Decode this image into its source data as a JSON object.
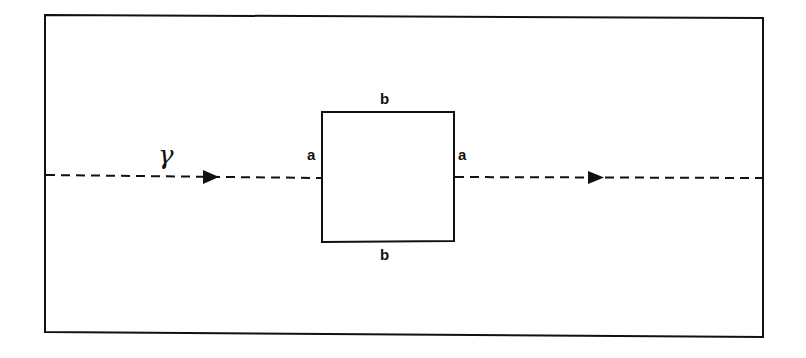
{
  "diagram": {
    "ray_label": "γ",
    "square": {
      "top_label": "b",
      "bottom_label": "b",
      "left_label": "a",
      "right_label": "a"
    },
    "colors": {
      "line": "#111111",
      "background": "#ffffff"
    }
  }
}
